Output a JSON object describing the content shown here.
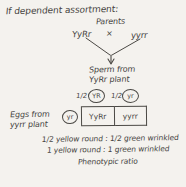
{
  "diagram": {
    "title": "If dependent assortment:",
    "parents": {
      "label": "Parents",
      "left_genotype": "YyRr",
      "cross_symbol": "×",
      "right_genotype": "yyrr"
    },
    "sperm": {
      "line1": "Sperm from",
      "line2": "YyRr plant",
      "gametes": [
        {
          "fraction": "1/2",
          "allele": "YR"
        },
        {
          "fraction": "1/2",
          "allele": "yr"
        }
      ]
    },
    "eggs": {
      "line1": "Eggs from",
      "line2": "yyrr plant",
      "gamete": "yr"
    },
    "punnett": {
      "cells": [
        "YyRr",
        "yyrr"
      ]
    },
    "results": {
      "ratio_line1": "1/2 yellow round : 1/2 green wrinkled",
      "ratio_line2": "1 yellow round : 1 green wrinkled",
      "caption": "Phenotypic ratio"
    },
    "colors": {
      "paper": "#f4f2ee",
      "ink": "#46443f"
    }
  }
}
